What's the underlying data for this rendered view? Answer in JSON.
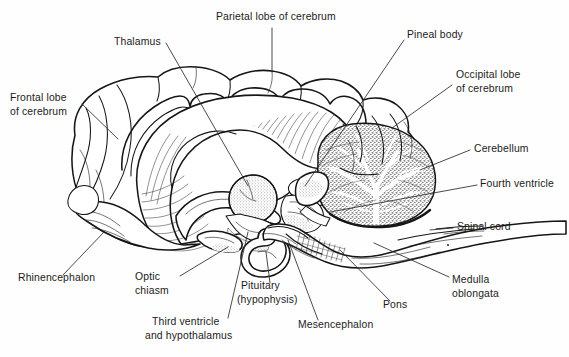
{
  "figure": {
    "background_color": "#fefefe",
    "ink_color": "#161616",
    "label_color": "#1b1b1b"
  },
  "labels": [
    {
      "id": "parietal-lobe",
      "text_lines": [
        "Parietal lobe of cerebrum"
      ],
      "x": 216,
      "y": 20,
      "anchor": "start"
    },
    {
      "id": "thalamus",
      "text_lines": [
        "Thalamus"
      ],
      "x": 114,
      "y": 45,
      "anchor": "start"
    },
    {
      "id": "pineal-body",
      "text_lines": [
        "Pineal body"
      ],
      "x": 407,
      "y": 38,
      "anchor": "start"
    },
    {
      "id": "occipital-lobe",
      "text_lines": [
        "Occipital lobe",
        "of cerebrum"
      ],
      "x": 456,
      "y": 78,
      "anchor": "start"
    },
    {
      "id": "frontal-lobe",
      "text_lines": [
        "Frontal lobe",
        "of cerebrum"
      ],
      "x": 10,
      "y": 101,
      "anchor": "start"
    },
    {
      "id": "cerebellum",
      "text_lines": [
        "Cerebellum"
      ],
      "x": 474,
      "y": 152,
      "anchor": "start"
    },
    {
      "id": "fourth-ventricle",
      "text_lines": [
        "Fourth ventricle"
      ],
      "x": 480,
      "y": 187,
      "anchor": "start"
    },
    {
      "id": "spinal-cord",
      "text_lines": [
        "Spinal cord"
      ],
      "x": 457,
      "y": 230,
      "anchor": "start"
    },
    {
      "id": "medulla-oblongata",
      "text_lines": [
        "Medulla",
        "oblongata"
      ],
      "x": 452,
      "y": 283,
      "anchor": "start"
    },
    {
      "id": "rhinencephalon",
      "text_lines": [
        "Rhinencephalon"
      ],
      "x": 18,
      "y": 281,
      "anchor": "start"
    },
    {
      "id": "optic-chiasm",
      "text_lines": [
        "Optic",
        "chiasm"
      ],
      "x": 135,
      "y": 280,
      "anchor": "start"
    },
    {
      "id": "pituitary",
      "text_lines": [
        "Pituitary",
        "(hypophysis)"
      ],
      "x": 241,
      "y": 289,
      "anchor": "start"
    },
    {
      "id": "third-ventricle",
      "text_lines": [
        "Third ventricle",
        "and hypothalamus"
      ],
      "x": 152,
      "y": 325,
      "anchor": "start"
    },
    {
      "id": "mesencephalon",
      "text_lines": [
        "Mesencephalon"
      ],
      "x": 298,
      "y": 328,
      "anchor": "start"
    },
    {
      "id": "pons",
      "text_lines": [
        "Pons"
      ],
      "x": 383,
      "y": 308,
      "anchor": "start"
    }
  ],
  "leader_lines": [
    {
      "id": "leader-parietal-lobe",
      "d": "M 272 28 L 272 72"
    },
    {
      "id": "leader-thalamus",
      "d": "M 166 43 L 200 89"
    },
    {
      "id": "leader-pineal-body",
      "d": "M 404 40 L 371 84"
    },
    {
      "id": "leader-occipital-lobe",
      "d": "M 452 85 L 400 110"
    },
    {
      "id": "leader-frontal-lobe",
      "d": "M 82 104 L 110 127"
    },
    {
      "id": "leader-cerebellum",
      "d": "M 470 150 L 428 170"
    },
    {
      "id": "leader-fourth-ventricle",
      "d": "M 477 185 L 410 199"
    },
    {
      "id": "leader-spinal-cord",
      "d": "M 453 228 L 432 231"
    },
    {
      "id": "leader-medulla",
      "d": "M 449 277 L 374 243"
    },
    {
      "id": "leader-rhinencephalon",
      "d": "M 63 275 L 100 243"
    },
    {
      "id": "leader-optic-chiasm",
      "d": "M 180 276 L 228 240"
    },
    {
      "id": "leader-pituitary",
      "d": "M 270 283 L 264 249"
    },
    {
      "id": "leader-third-ventricle",
      "d": "M 228 318 L 245 231"
    },
    {
      "id": "leader-mesencephalon",
      "d": "M 318 320 L 287 243"
    },
    {
      "id": "leader-pons",
      "d": "M 390 301 L 345 240"
    }
  ],
  "structures": [
    {
      "id": "cerebrum-outline",
      "name": "cerebrum"
    },
    {
      "id": "corpus-callosum",
      "name": "corpus callosum"
    },
    {
      "id": "thalamus-body",
      "name": "thalamus"
    },
    {
      "id": "cerebellum-body",
      "name": "cerebellum (arbor vitae)"
    },
    {
      "id": "brainstem-body",
      "name": "brainstem, pons and medulla"
    },
    {
      "id": "pituitary-body",
      "name": "pituitary gland"
    },
    {
      "id": "optic-chiasm-body",
      "name": "optic chiasm"
    },
    {
      "id": "spinal-cord-body",
      "name": "spinal cord"
    }
  ]
}
